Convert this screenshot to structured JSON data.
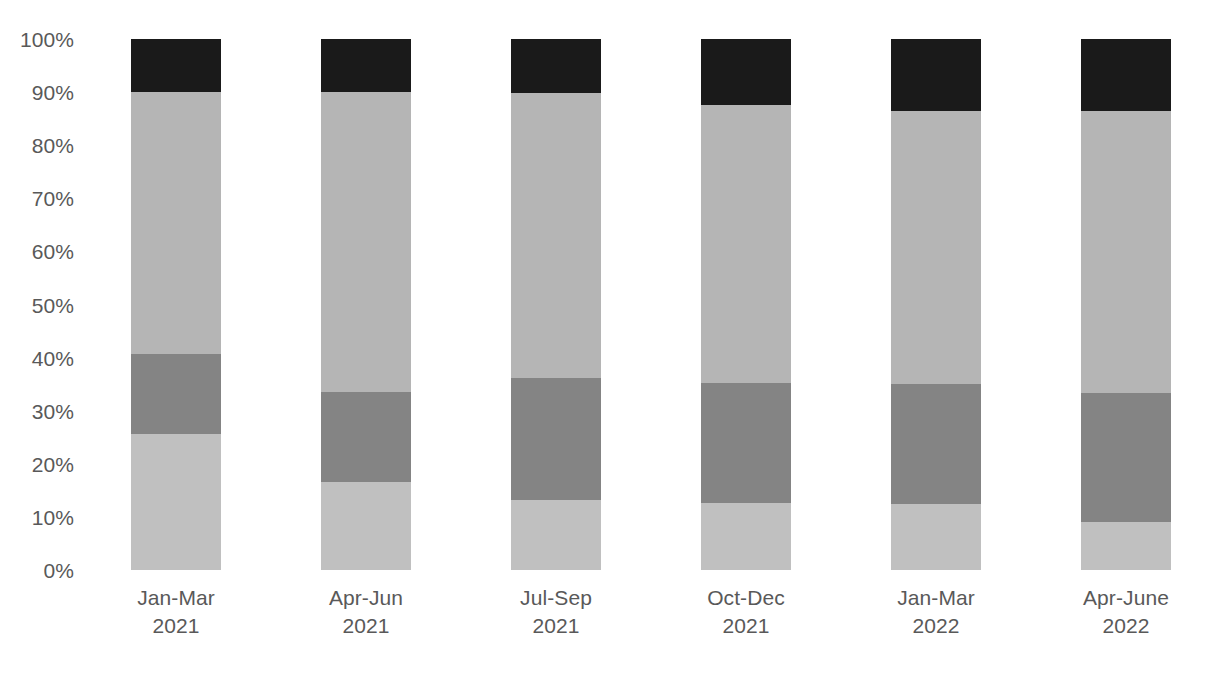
{
  "chart_data": {
    "type": "bar",
    "variant": "stacked-100-percent",
    "title": "",
    "subtitle": "",
    "xlabel": "",
    "ylabel": "",
    "ylim": [
      0,
      100
    ],
    "yticks": [
      "0%",
      "10%",
      "20%",
      "30%",
      "40%",
      "50%",
      "60%",
      "70%",
      "80%",
      "90%",
      "100%"
    ],
    "ytick_values": [
      0,
      10,
      20,
      30,
      40,
      50,
      60,
      70,
      80,
      90,
      100
    ],
    "grid": false,
    "legend": "none",
    "categories": [
      "Jan-Mar 2021",
      "Apr-Jun 2021",
      "Jul-Sep 2021",
      "Oct-Dec 2021",
      "Jan-Mar 2022",
      "Apr-June 2022"
    ],
    "category_lines": [
      {
        "period": "Jan-Mar",
        "year": "2021"
      },
      {
        "period": "Apr-Jun",
        "year": "2021"
      },
      {
        "period": "Jul-Sep",
        "year": "2021"
      },
      {
        "period": "Oct-Dec",
        "year": "2021"
      },
      {
        "period": "Jan-Mar",
        "year": "2022"
      },
      {
        "period": "Apr-June",
        "year": "2022"
      }
    ],
    "series": [
      {
        "name": "Segment 1 (bottom, light grey)",
        "color": "#c0c0c0",
        "values": [
          25.6,
          16.6,
          13.2,
          12.6,
          12.4,
          9.0
        ]
      },
      {
        "name": "Segment 2 (mid grey)",
        "color": "#848484",
        "values": [
          15.1,
          16.9,
          23.0,
          22.6,
          22.6,
          24.3
        ]
      },
      {
        "name": "Segment 3 (light grey)",
        "color": "#b5b5b5",
        "values": [
          49.3,
          56.5,
          53.6,
          52.4,
          51.4,
          53.1
        ]
      },
      {
        "name": "Segment 4 (top, black)",
        "color": "#1a1a1a",
        "values": [
          10.0,
          10.0,
          10.2,
          12.4,
          13.6,
          13.6
        ]
      }
    ],
    "cumulative_tops": [
      [
        25.6,
        40.7,
        90.0,
        100.0
      ],
      [
        16.6,
        33.5,
        90.0,
        100.0
      ],
      [
        13.2,
        36.2,
        89.8,
        100.0
      ],
      [
        12.6,
        35.2,
        87.6,
        100.0
      ],
      [
        12.4,
        35.0,
        86.4,
        100.0
      ],
      [
        9.0,
        33.3,
        86.4,
        100.0
      ]
    ]
  },
  "colors": {
    "background": "#ffffff",
    "tick_text": "#595959",
    "segment_1": "#c0c0c0",
    "segment_2": "#848484",
    "segment_3": "#b5b5b5",
    "segment_4": "#1a1a1a"
  }
}
